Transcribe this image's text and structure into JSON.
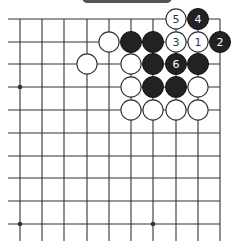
{
  "diagram": {
    "title_pill": "",
    "caption": "",
    "grid": {
      "cols_x": [
        20,
        42,
        64,
        87,
        109,
        131,
        153,
        176,
        198,
        220
      ],
      "rows_y": [
        19,
        42,
        64,
        87,
        110,
        133,
        156,
        178,
        201,
        224
      ],
      "left_overhang_x": 8,
      "bottom_overhang_y": 241,
      "right_edge": true,
      "top_edge": true,
      "star_points": [
        [
          0,
          3
        ],
        [
          0,
          9
        ],
        [
          6,
          9
        ]
      ]
    },
    "stone_radius": 10.5,
    "colors": {
      "line": "#333333",
      "black_stone": "#222222",
      "white_stone": "#ffffff",
      "white_border": "#333333",
      "label_on_black": "#ffffff",
      "label_on_white": "#333333"
    },
    "stones": [
      {
        "col": 7,
        "row": 0,
        "color": "white",
        "label": "5"
      },
      {
        "col": 8,
        "row": 0,
        "color": "black",
        "label": "4"
      },
      {
        "col": 4,
        "row": 1,
        "color": "white",
        "label": ""
      },
      {
        "col": 5,
        "row": 1,
        "color": "black",
        "label": ""
      },
      {
        "col": 6,
        "row": 1,
        "color": "black",
        "label": ""
      },
      {
        "col": 7,
        "row": 1,
        "color": "white",
        "label": "3"
      },
      {
        "col": 8,
        "row": 1,
        "color": "white",
        "label": "1"
      },
      {
        "col": 9,
        "row": 1,
        "color": "black",
        "label": "2"
      },
      {
        "col": 3,
        "row": 2,
        "color": "white",
        "label": ""
      },
      {
        "col": 5,
        "row": 2,
        "color": "white",
        "label": ""
      },
      {
        "col": 6,
        "row": 2,
        "color": "black",
        "label": ""
      },
      {
        "col": 7,
        "row": 2,
        "color": "black",
        "label": "6"
      },
      {
        "col": 8,
        "row": 2,
        "color": "black",
        "label": ""
      },
      {
        "col": 5,
        "row": 3,
        "color": "white",
        "label": ""
      },
      {
        "col": 6,
        "row": 3,
        "color": "black",
        "label": ""
      },
      {
        "col": 7,
        "row": 3,
        "color": "black",
        "label": ""
      },
      {
        "col": 8,
        "row": 3,
        "color": "white",
        "label": ""
      },
      {
        "col": 5,
        "row": 4,
        "color": "white",
        "label": ""
      },
      {
        "col": 6,
        "row": 4,
        "color": "white",
        "label": ""
      },
      {
        "col": 7,
        "row": 4,
        "color": "white",
        "label": ""
      },
      {
        "col": 8,
        "row": 4,
        "color": "white",
        "label": ""
      }
    ]
  }
}
